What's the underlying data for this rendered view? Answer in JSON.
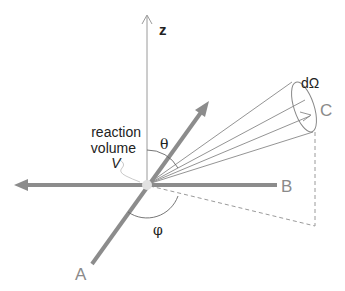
{
  "diagram": {
    "labels": {
      "z_axis": "z",
      "beam_a": "A",
      "beam_b": "B",
      "detector": "C",
      "solid_angle": "dΩ",
      "theta": "θ",
      "phi": "φ",
      "reaction_line1": "reaction",
      "reaction_line2": "volume",
      "reaction_var": "V"
    },
    "colors": {
      "thick_axis": "#8c8c8c",
      "thin_line": "#888888",
      "text": "#222222",
      "label_gray": "#8a8a8a",
      "origin_spot": "#dddddd"
    }
  }
}
